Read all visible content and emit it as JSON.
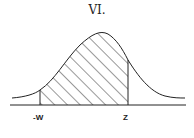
{
  "title": "VI.",
  "diagram": {
    "type": "normal-distribution-curve",
    "shaded_region": {
      "from": "-W",
      "to": "Z",
      "pattern": "diagonal-hatch"
    },
    "labels": {
      "left": "-W",
      "right": "Z"
    }
  }
}
